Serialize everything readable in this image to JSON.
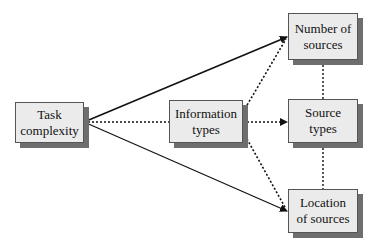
{
  "diagram": {
    "type": "flow",
    "nodes": {
      "task": {
        "line1": "Task",
        "line2": "complexity"
      },
      "info": {
        "line1": "Information",
        "line2": "types"
      },
      "number": {
        "line1": "Number of",
        "line2": "sources"
      },
      "source_types": {
        "line1": "Source",
        "line2": "types"
      },
      "location": {
        "line1": "Location",
        "line2": "of sources"
      }
    },
    "edges": [
      {
        "from": "Task complexity",
        "to": "Number of sources",
        "style": "solid",
        "arrow": true
      },
      {
        "from": "Task complexity",
        "to": "Information types",
        "style": "dotted",
        "arrow": false
      },
      {
        "from": "Task complexity",
        "to": "Location of sources",
        "style": "solid",
        "arrow": true
      },
      {
        "from": "Information types",
        "to": "Number of sources",
        "style": "dotted",
        "arrow": true
      },
      {
        "from": "Information types",
        "to": "Source types",
        "style": "dotted",
        "arrow": true
      },
      {
        "from": "Information types",
        "to": "Location of sources",
        "style": "dotted",
        "arrow": true
      },
      {
        "from": "Number of sources",
        "to": "Source types",
        "style": "dotted",
        "arrow": false
      },
      {
        "from": "Source types",
        "to": "Location of sources",
        "style": "dotted",
        "arrow": false
      }
    ],
    "colors": {
      "box_fill": "#ebebeb",
      "box_shadow": "#6e6e6e",
      "line": "#111111"
    }
  }
}
